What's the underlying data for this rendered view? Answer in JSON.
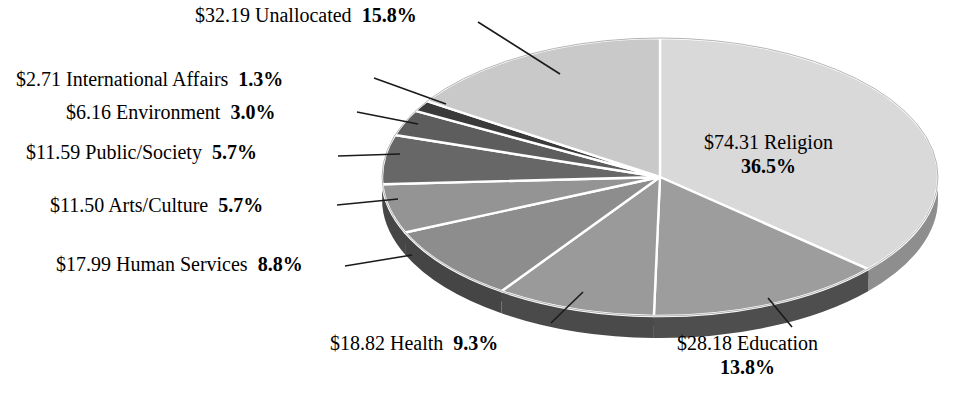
{
  "chart_data": {
    "type": "pie",
    "title": "",
    "subtitle": "",
    "xlabel": "",
    "ylabel": "",
    "legend_position": "none",
    "grid": false,
    "units": "billions of dollars",
    "value_prefix": "$",
    "total_percent": 99.9,
    "start_angle_deg": 0,
    "direction": "clockwise",
    "categories": [
      "Religion",
      "Education",
      "Health",
      "Human Services",
      "Arts/Culture",
      "Public/Society",
      "Environment",
      "International Affairs",
      "Unallocated"
    ],
    "values": [
      74.31,
      28.18,
      18.82,
      17.99,
      11.5,
      11.59,
      6.16,
      2.71,
      32.19
    ],
    "percents": [
      36.5,
      13.8,
      9.3,
      8.8,
      5.7,
      5.7,
      3.0,
      1.3,
      15.8
    ],
    "slices": [
      {
        "name": "Religion",
        "amount": "$74.31",
        "label": "Religion",
        "percent": "36.5%",
        "value": 74.31,
        "pct": 36.5,
        "color": "#d9d9d9",
        "side_color": "#8e8e8e"
      },
      {
        "name": "Education",
        "amount": "$28.18",
        "label": "Education",
        "percent": "13.8%",
        "value": 28.18,
        "pct": 13.8,
        "color": "#9d9d9d",
        "side_color": "#4e4e4e"
      },
      {
        "name": "Health",
        "amount": "$18.82",
        "label": "Health",
        "percent": "9.3%",
        "value": 18.82,
        "pct": 9.3,
        "color": "#9a9a9a",
        "side_color": "#4a4a4a"
      },
      {
        "name": "Human Services",
        "amount": "$17.99",
        "label": "Human Services",
        "percent": "8.8%",
        "value": 17.99,
        "pct": 8.8,
        "color": "#8d8d8d",
        "side_color": "#454545"
      },
      {
        "name": "Arts/Culture",
        "amount": "$11.50",
        "label": "Arts/Culture",
        "percent": "5.7%",
        "value": 11.5,
        "pct": 5.7,
        "color": "#949494",
        "side_color": "#464646"
      },
      {
        "name": "Public/Society",
        "amount": "$11.59",
        "label": "Public/Society",
        "percent": "5.7%",
        "value": 11.59,
        "pct": 5.7,
        "color": "#676767",
        "side_color": "#3a3a3a"
      },
      {
        "name": "Environment",
        "amount": "$6.16",
        "label": "Environment",
        "percent": "3.0%",
        "value": 6.16,
        "pct": 3.0,
        "color": "#5d5d5d",
        "side_color": "#353535"
      },
      {
        "name": "International Affairs",
        "amount": "$2.71",
        "label": "International Affairs",
        "percent": "1.3%",
        "value": 2.71,
        "pct": 1.3,
        "color": "#3a3a3a",
        "side_color": "#2a2a2a"
      },
      {
        "name": "Unallocated",
        "amount": "$32.19",
        "label": "Unallocated",
        "percent": "15.8%",
        "value": 32.19,
        "pct": 15.8,
        "color": "#c9c9c9",
        "side_color": "#858585"
      }
    ]
  },
  "labels": {
    "unallocated": {
      "amount": "$32.19",
      "name": "Unallocated",
      "percent": "15.8%"
    },
    "international": {
      "amount": "$2.71",
      "name": "International Affairs",
      "percent": "1.3%"
    },
    "environment": {
      "amount": "$6.16",
      "name": "Environment",
      "percent": "3.0%"
    },
    "public": {
      "amount": "$11.59",
      "name": "Public/Society",
      "percent": "5.7%"
    },
    "arts": {
      "amount": "$11.50",
      "name": "Arts/Culture",
      "percent": "5.7%"
    },
    "human": {
      "amount": "$17.99",
      "name": "Human Services",
      "percent": "8.8%"
    },
    "health": {
      "amount": "$18.82",
      "name": "Health",
      "percent": "9.3%"
    },
    "education": {
      "amount": "$28.18",
      "name": "Education",
      "percent": "13.8%"
    },
    "religion": {
      "amount": "$74.31",
      "name": "Religion",
      "percent": "36.5%"
    }
  },
  "style": {
    "background": "#ffffff",
    "text_color": "#000000",
    "slice_separator": "#ffffff",
    "leader_line": "#1a1a1a"
  }
}
